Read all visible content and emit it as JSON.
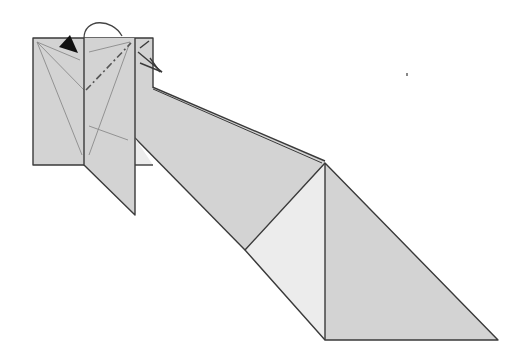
{
  "diagram": {
    "type": "origami-fold-step",
    "colors": {
      "paper": "#d3d3d3",
      "paper_light": "#ececec",
      "edge": "#3a3a3a",
      "crease": "#8a8a8a",
      "arrow": "#111111"
    },
    "symbols": [
      {
        "name": "valley-fold-arrow",
        "meaning": "fold flap over"
      },
      {
        "name": "push-arrowhead",
        "meaning": "fold direction"
      },
      {
        "name": "mountain-fold-line",
        "meaning": "dash-dot fold line"
      }
    ]
  }
}
